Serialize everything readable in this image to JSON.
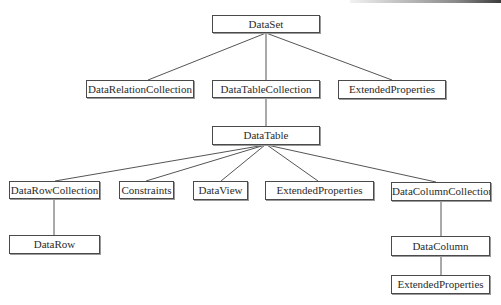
{
  "diagram": {
    "type": "tree",
    "title": "",
    "nodes": [
      {
        "id": "dataset",
        "label": "DataSet",
        "x": 212,
        "y": 15,
        "w": 108,
        "h": 18
      },
      {
        "id": "datarelationcollection",
        "label": "DataRelationCollection",
        "x": 86,
        "y": 80,
        "w": 108,
        "h": 18
      },
      {
        "id": "datatablecollection",
        "label": "DataTableCollection",
        "x": 212,
        "y": 80,
        "w": 108,
        "h": 18
      },
      {
        "id": "extendedproperties-dataset",
        "label": "ExtendedProperties",
        "x": 338,
        "y": 80,
        "w": 108,
        "h": 19
      },
      {
        "id": "datatable",
        "label": "DataTable",
        "x": 212,
        "y": 126,
        "w": 108,
        "h": 19
      },
      {
        "id": "datarowcollection",
        "label": "DataRowCollection",
        "x": 9,
        "y": 181,
        "w": 91,
        "h": 18
      },
      {
        "id": "constraints",
        "label": "Constraints",
        "x": 119,
        "y": 181,
        "w": 55,
        "h": 18
      },
      {
        "id": "dataview",
        "label": "DataView",
        "x": 193,
        "y": 181,
        "w": 55,
        "h": 19
      },
      {
        "id": "extendedproperties-datatable",
        "label": "ExtendedProperties",
        "x": 265,
        "y": 181,
        "w": 109,
        "h": 19
      },
      {
        "id": "datacolumncollection",
        "label": "DataColumnCollection",
        "x": 391,
        "y": 182,
        "w": 100,
        "h": 19
      },
      {
        "id": "datarow",
        "label": "DataRow",
        "x": 9,
        "y": 235,
        "w": 91,
        "h": 19
      },
      {
        "id": "datacolumn",
        "label": "DataColumn",
        "x": 391,
        "y": 236,
        "w": 99,
        "h": 20
      },
      {
        "id": "extendedproperties-datacolumn",
        "label": "ExtendedProperties",
        "x": 391,
        "y": 275,
        "w": 99,
        "h": 19
      }
    ],
    "edges": [
      {
        "from": "dataset",
        "to": "datarelationcollection",
        "x1": 266,
        "y1": 33,
        "x2": 148,
        "y2": 80
      },
      {
        "from": "dataset",
        "to": "datatablecollection",
        "x1": 266,
        "y1": 33,
        "x2": 266,
        "y2": 80
      },
      {
        "from": "dataset",
        "to": "extendedproperties-dataset",
        "x1": 266,
        "y1": 33,
        "x2": 392,
        "y2": 80
      },
      {
        "from": "datatablecollection",
        "to": "datatable",
        "x1": 266,
        "y1": 98,
        "x2": 266,
        "y2": 126
      },
      {
        "from": "datatable",
        "to": "datarowcollection",
        "x1": 265,
        "y1": 145,
        "x2": 55,
        "y2": 181
      },
      {
        "from": "datatable",
        "to": "constraints",
        "x1": 265,
        "y1": 145,
        "x2": 146,
        "y2": 181
      },
      {
        "from": "datatable",
        "to": "dataview",
        "x1": 265,
        "y1": 145,
        "x2": 221,
        "y2": 181
      },
      {
        "from": "datatable",
        "to": "extendedproperties-datatable",
        "x1": 267,
        "y1": 145,
        "x2": 318,
        "y2": 181
      },
      {
        "from": "datatable",
        "to": "datacolumncollection",
        "x1": 267,
        "y1": 145,
        "x2": 436,
        "y2": 182
      },
      {
        "from": "datarowcollection",
        "to": "datarow",
        "x1": 54,
        "y1": 199,
        "x2": 54,
        "y2": 235
      },
      {
        "from": "datacolumncollection",
        "to": "datacolumn",
        "x1": 441,
        "y1": 201,
        "x2": 441,
        "y2": 236
      },
      {
        "from": "datacolumn",
        "to": "extendedproperties-datacolumn",
        "x1": 441,
        "y1": 256,
        "x2": 441,
        "y2": 275
      }
    ],
    "colors": {
      "background": "#ffffff",
      "border": "#4a4a4a",
      "line": "#555555",
      "text": "#2b2b2b"
    }
  }
}
